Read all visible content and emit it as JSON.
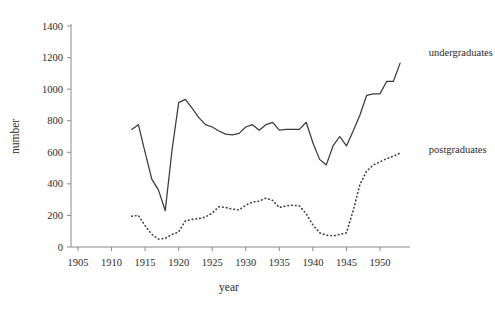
{
  "chart_data": {
    "type": "line",
    "title": "",
    "xlabel": "year",
    "ylabel": "number",
    "xlim": [
      1905,
      1953
    ],
    "ylim": [
      0,
      1400
    ],
    "grid": false,
    "legend_position": "inline-right-of-series-end",
    "xticks": [
      1905,
      1910,
      1915,
      1920,
      1925,
      1930,
      1935,
      1940,
      1945,
      1950
    ],
    "xtick_labels": [
      "1905",
      "1910",
      "1915",
      "1920",
      "1925",
      "1930",
      "1935",
      "1940",
      "1945",
      "1950"
    ],
    "yticks": [
      0,
      200,
      400,
      600,
      800,
      1000,
      1200,
      1400
    ],
    "ytick_labels": [
      "0",
      "200",
      "400",
      "600",
      "800",
      "1000",
      "1200",
      "1400"
    ],
    "series": [
      {
        "name": "undergraduates",
        "style": "solid",
        "color": "#3a3a3a",
        "label_position": {
          "x": 1954,
          "y": 1235
        },
        "x": [
          1913,
          1914,
          1915,
          1916,
          1917,
          1918,
          1919,
          1920,
          1921,
          1922,
          1923,
          1924,
          1925,
          1926,
          1927,
          1928,
          1929,
          1930,
          1931,
          1932,
          1933,
          1934,
          1935,
          1936,
          1937,
          1938,
          1939,
          1940,
          1941,
          1942,
          1943,
          1944,
          1945,
          1946,
          1947,
          1948,
          1949,
          1950,
          1951,
          1952,
          1953
        ],
        "values": [
          745,
          775,
          600,
          430,
          360,
          230,
          610,
          915,
          935,
          880,
          820,
          775,
          760,
          735,
          715,
          710,
          720,
          760,
          775,
          740,
          775,
          790,
          740,
          745,
          745,
          745,
          790,
          660,
          555,
          520,
          640,
          700,
          640,
          735,
          835,
          960,
          970,
          970,
          1050,
          1050,
          1165
        ]
      },
      {
        "name": "postgraduates",
        "style": "dotted",
        "color": "#3a3a3a",
        "label_position": {
          "x": 1954,
          "y": 620
        },
        "x": [
          1913,
          1914,
          1915,
          1916,
          1917,
          1918,
          1919,
          1920,
          1921,
          1922,
          1923,
          1924,
          1925,
          1926,
          1927,
          1928,
          1929,
          1930,
          1931,
          1932,
          1933,
          1934,
          1935,
          1936,
          1937,
          1938,
          1939,
          1940,
          1941,
          1942,
          1943,
          1944,
          1945,
          1946,
          1947,
          1948,
          1949,
          1950,
          1951,
          1952,
          1953
        ],
        "values": [
          195,
          200,
          135,
          80,
          50,
          55,
          80,
          95,
          165,
          175,
          180,
          190,
          215,
          255,
          250,
          240,
          235,
          265,
          285,
          290,
          310,
          295,
          250,
          260,
          265,
          260,
          210,
          140,
          90,
          75,
          70,
          80,
          90,
          230,
          395,
          480,
          520,
          540,
          560,
          575,
          595
        ]
      }
    ]
  },
  "axis": {
    "y_title": "number",
    "x_title": "year"
  }
}
